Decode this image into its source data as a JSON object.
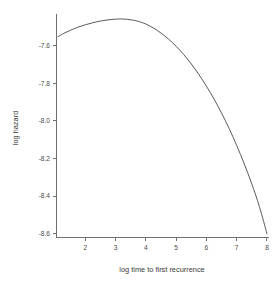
{
  "chart_data": {
    "type": "line",
    "title": "",
    "xlabel": "log time to first recurrence",
    "ylabel": "log hazard",
    "xlim": [
      1.05,
      8.05
    ],
    "ylim": [
      -8.62,
      -7.43
    ],
    "grid": false,
    "legend": null,
    "xticks": [
      2,
      3,
      4,
      5,
      6,
      7,
      8
    ],
    "xtick_labels": [
      "2",
      "3",
      "4",
      "5",
      "6",
      "7",
      "8"
    ],
    "yticks": [
      -7.6,
      -7.8,
      -8.0,
      -8.2,
      -8.4,
      -8.6
    ],
    "ytick_labels": [
      "-7.6",
      "-7.8",
      "-8.0",
      "-8.2",
      "-8.4",
      "-8.6"
    ],
    "series": [
      {
        "name": "log hazard",
        "color": "#5a5a5a",
        "x": [
          1.1,
          1.3,
          1.5,
          1.75,
          2.0,
          2.25,
          2.5,
          2.75,
          3.0,
          3.2,
          3.4,
          3.6,
          3.8,
          4.0,
          4.25,
          4.5,
          4.75,
          5.0,
          5.25,
          5.5,
          5.75,
          6.0,
          6.25,
          6.5,
          6.75,
          7.0,
          7.25,
          7.5,
          7.75,
          8.0
        ],
        "y": [
          -7.553,
          -7.535,
          -7.52,
          -7.503,
          -7.49,
          -7.479,
          -7.47,
          -7.464,
          -7.46,
          -7.459,
          -7.461,
          -7.466,
          -7.474,
          -7.486,
          -7.507,
          -7.534,
          -7.566,
          -7.604,
          -7.648,
          -7.698,
          -7.754,
          -7.816,
          -7.884,
          -7.959,
          -8.041,
          -8.131,
          -8.229,
          -8.336,
          -8.456,
          -8.6
        ]
      }
    ],
    "axes_color": "#6f6f6f"
  },
  "labels": {
    "x_axis_title": "log time to first recurrence",
    "y_axis_title": "log hazard"
  }
}
